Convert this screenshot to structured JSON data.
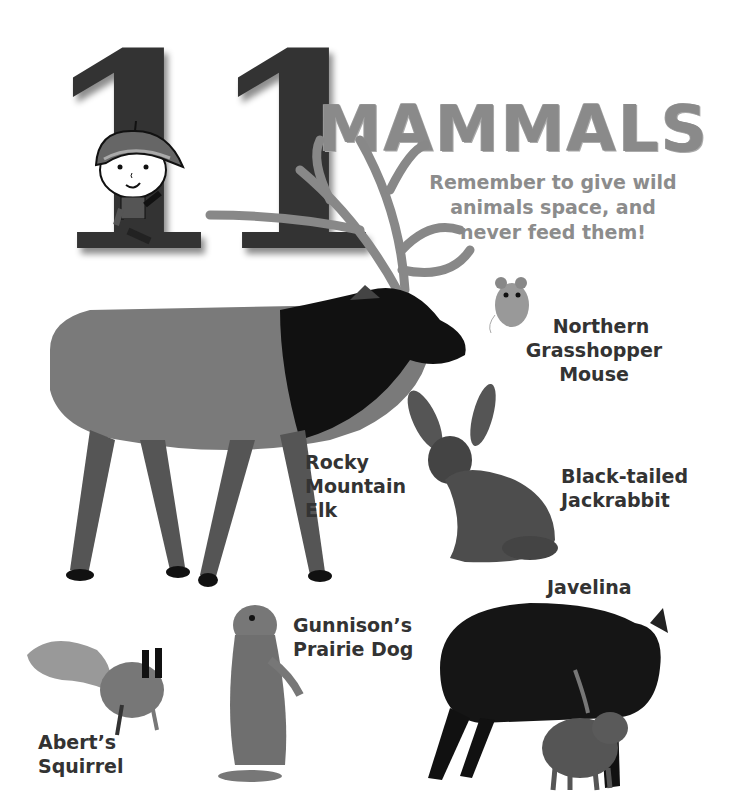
{
  "header": {
    "number": "11",
    "digits": [
      "1",
      "1"
    ],
    "title": "MAMMALS",
    "tip_lines": [
      "Remember to give wild",
      "animals space, and",
      "never feed them!"
    ]
  },
  "mascot": {
    "description": "cartoon ranger child in hat waving"
  },
  "animals": [
    {
      "name": "Northern Grasshopper Mouse",
      "label_lines": [
        "Northern",
        "Grasshopper",
        "Mouse"
      ]
    },
    {
      "name": "Rocky Mountain Elk",
      "label_lines": [
        "Rocky",
        "Mountain",
        "Elk"
      ]
    },
    {
      "name": "Black-tailed Jackrabbit",
      "label_lines": [
        "Black-tailed",
        "Jackrabbit"
      ]
    },
    {
      "name": "Javelina",
      "label_lines": [
        "Javelina"
      ]
    },
    {
      "name": "Gunnison's Prairie Dog",
      "label_lines": [
        "Gunnison’s",
        "Prairie Dog"
      ]
    },
    {
      "name": "Abert's Squirrel",
      "label_lines": [
        "Abert’s",
        "Squirrel"
      ]
    }
  ],
  "colors": {
    "digit": "#333333",
    "title": "#8a8a8a",
    "label": "#333333",
    "background": "#ffffff"
  }
}
